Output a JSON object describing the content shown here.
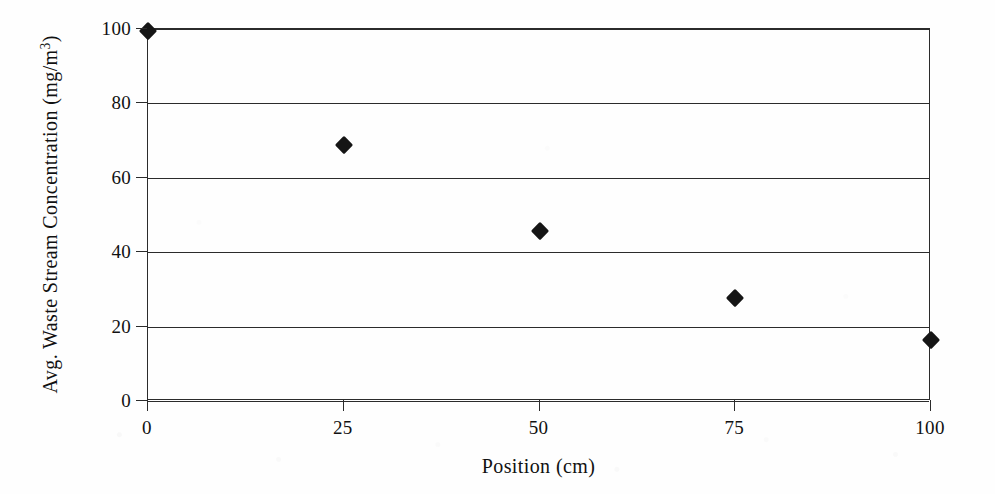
{
  "figure": {
    "background_color": "#fefefe",
    "ink_color": "#2b2b2b",
    "marker_color": "#151515"
  },
  "chart_data": {
    "type": "scatter",
    "title": "",
    "subtitle": "",
    "xlabel": "Position (cm)",
    "ylabel": "Avg. Waste Stream Concentration (mg/m",
    "ylabel_exponent": "3",
    "ylabel_suffix": ")",
    "x": [
      0,
      25,
      50,
      75,
      100
    ],
    "values": [
      99.5,
      68.7,
      45.8,
      27.8,
      16.3
    ],
    "series": [
      {
        "name": "Avg. Waste Stream Concentration",
        "marker": "filled-diamond",
        "color": "#151515",
        "points": [
          {
            "x": 0,
            "y": 99.5
          },
          {
            "x": 25,
            "y": 68.7
          },
          {
            "x": 50,
            "y": 45.8
          },
          {
            "x": 75,
            "y": 27.8
          },
          {
            "x": 100,
            "y": 16.3
          }
        ]
      }
    ],
    "xlim": [
      0,
      100
    ],
    "ylim": [
      0,
      100
    ],
    "xticks": [
      0,
      25,
      50,
      75,
      100
    ],
    "yticks": [
      0,
      20,
      40,
      60,
      80,
      100
    ],
    "xtick_labels": [
      "0",
      "25",
      "50",
      "75",
      "100"
    ],
    "ytick_labels": [
      "0",
      "20",
      "40",
      "60",
      "80",
      "100"
    ],
    "grid": "horizontal",
    "gridlines_y": [
      0,
      20,
      40,
      60,
      80,
      100
    ],
    "legend": null,
    "legend_position": "none",
    "annotations": []
  }
}
